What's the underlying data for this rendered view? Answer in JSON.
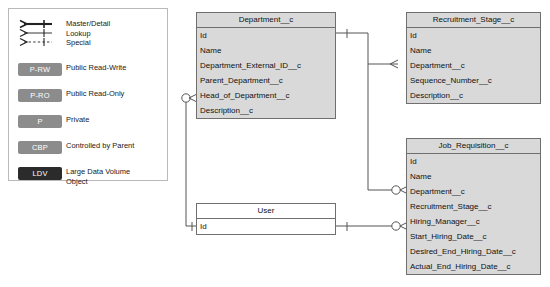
{
  "legend": {
    "relationship_symbols": [
      {
        "name": "master-detail",
        "label": "Master/Detail",
        "style": "thick-solid"
      },
      {
        "name": "lookup",
        "label": "Lookup",
        "style": "thin-solid"
      },
      {
        "name": "special",
        "label": "Special",
        "style": "thin-dashed"
      }
    ],
    "badges": [
      {
        "code": "P-RW",
        "label": "Public Read-Write",
        "color": "#8c8c8c"
      },
      {
        "code": "P-RO",
        "label": "Public Read-Only",
        "color": "#8c8c8c"
      },
      {
        "code": "P",
        "label": "Private",
        "color": "#8c8c8c"
      },
      {
        "code": "CBP",
        "label": "Controlled by Parent",
        "color": "#8c8c8c"
      },
      {
        "code": "LDV",
        "label": "Large Data Volume\nObject",
        "color": "#2b2b2b"
      }
    ]
  },
  "entities": {
    "department": {
      "title": "Department__c",
      "fields": [
        "Id",
        "Name",
        "Department_External_ID__c",
        "Parent_Department__c",
        "Head_of_Department__c",
        "Description__c"
      ]
    },
    "recruitment_stage": {
      "title": "Recruitment_Stage__c",
      "fields": [
        "Id",
        "Name",
        "Department__c",
        "Sequence_Number__c",
        "Description__c"
      ]
    },
    "job_requisition": {
      "title": "Job_Requisition__c",
      "fields": [
        "Id",
        "Name",
        "Department__c",
        "Recruitment_Stage__c",
        "Hiring_Manager__c",
        "Start_Hiring_Date__c",
        "Desired_End_Hiring_Date__c",
        "Actual_End_Hiring_Date__c"
      ]
    },
    "user": {
      "title": "User",
      "fields": [
        "Id"
      ]
    }
  }
}
